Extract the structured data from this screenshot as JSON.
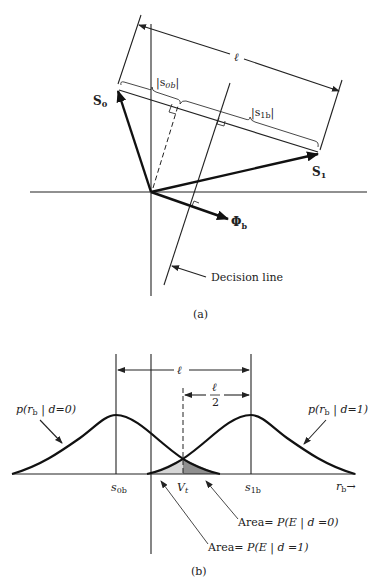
{
  "figure_a": {
    "caption": "(a)",
    "length_label": "ℓ",
    "s0b_label": "|s",
    "s0b_sub": "0b",
    "s0b_close": "|",
    "s1b_label": "|s",
    "s1b_sub": "1b",
    "s1b_close": "|",
    "vector_s0": "S",
    "vector_s0_sub": "0",
    "vector_s1": "S",
    "vector_s1_sub": "1",
    "vector_phi": "Φ",
    "vector_phi_sub": "b",
    "decision_line_label": "Decision line"
  },
  "figure_b": {
    "caption": "(b)",
    "length_label": "ℓ",
    "half_length_num": "ℓ",
    "half_length_den": "2",
    "pdf_left": {
      "prefix": "p(r",
      "sub": "b",
      "suffix": " | d=0)"
    },
    "pdf_right": {
      "prefix": "p(r",
      "sub": "b",
      "suffix": " | d=1)"
    },
    "tick_s0b": {
      "main": "s",
      "sub": "0b"
    },
    "tick_vt": {
      "main": "V",
      "sub": "t"
    },
    "tick_s1b": {
      "main": "s",
      "sub": "1b"
    },
    "axis_label": {
      "main": "r",
      "sub": "b",
      "arrow": "→"
    },
    "area_d0": {
      "prefix": "Area= ",
      "expr": "P(E | d  =0)"
    },
    "area_d1": {
      "prefix": "Area= ",
      "expr": "P(E | d  =1)"
    },
    "colors": {
      "area_d1_fill": "#d6d6d6",
      "area_d0_fill": "#8f8f8f"
    }
  }
}
